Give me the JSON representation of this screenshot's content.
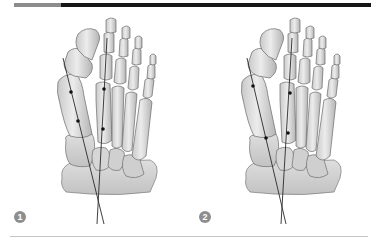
{
  "figure": {
    "header_bar": {
      "accent_color": "#8c8c8c",
      "bar_color": "#161616"
    },
    "panels": [
      {
        "label": "1",
        "offset_x": 0,
        "first_ray_axis": {
          "x1": 63,
          "y1": 58,
          "x2": 104,
          "y2": 224
        },
        "second_ray_axis": {
          "x1": 107,
          "y1": 38,
          "x2": 97,
          "y2": 224
        },
        "first_ray_points": [
          {
            "x": 71,
            "y": 92
          },
          {
            "x": 78,
            "y": 121
          }
        ],
        "second_ray_points": [
          {
            "x": 104,
            "y": 89
          },
          {
            "x": 103,
            "y": 129
          }
        ]
      },
      {
        "label": "2",
        "offset_x": 184,
        "first_ray_axis": {
          "x1": 247,
          "y1": 58,
          "x2": 286,
          "y2": 224
        },
        "second_ray_axis": {
          "x1": 292,
          "y1": 38,
          "x2": 281,
          "y2": 224
        },
        "first_ray_points": [
          {
            "x": 253,
            "y": 86
          },
          {
            "x": 266,
            "y": 138
          }
        ],
        "second_ray_points": [
          {
            "x": 290,
            "y": 93
          },
          {
            "x": 288,
            "y": 133
          }
        ]
      }
    ],
    "colors": {
      "bone_fill": "#e4e4e4",
      "bone_shade": "#b8b8b8",
      "bone_outline": "#707070",
      "axis_line": "#2a2a2a",
      "badge": "#8e8e8e",
      "rule": "#c4c4c4"
    }
  }
}
